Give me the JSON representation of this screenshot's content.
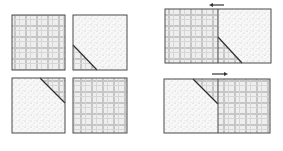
{
  "diagram": {
    "colors": {
      "background": "#ffffff",
      "outline": "#4a4a4a",
      "plaid_base": "#ececec",
      "plaid_line": "#b8b8b8",
      "dot_base": "#f7f7f7",
      "dot": "#b0b0b0"
    },
    "squares": [
      {
        "id": "plaid-square-top-left",
        "fabric": "plaid",
        "x": 12,
        "y": 15,
        "w": 53,
        "h": 55
      },
      {
        "id": "dotted-square-top-right",
        "fabric": "dotted",
        "x": 73,
        "y": 15,
        "w": 54,
        "h": 55,
        "corner": "bottom-left",
        "corner_fabric": "plaid"
      },
      {
        "id": "dotted-square-bottom-left",
        "fabric": "dotted",
        "x": 12,
        "y": 78,
        "w": 53,
        "h": 55,
        "corner": "top-right",
        "corner_fabric": "plaid"
      },
      {
        "id": "plaid-square-bottom-right",
        "fabric": "plaid",
        "x": 73,
        "y": 78,
        "w": 54,
        "h": 55
      }
    ],
    "units": [
      {
        "id": "unit-top",
        "x": 165,
        "y": 9,
        "w": 106,
        "h": 54,
        "divider_x": 218,
        "left": "plaid",
        "right": "dotted",
        "arrow": "left"
      },
      {
        "id": "unit-bottom",
        "x": 164,
        "y": 79,
        "w": 106,
        "h": 54,
        "divider_x": 218,
        "left": "dotted",
        "right": "plaid",
        "arrow": "right"
      }
    ],
    "arrows": [
      {
        "id": "press-arrow-left",
        "direction": "left",
        "x1": 224,
        "x2": 209,
        "y": 5
      },
      {
        "id": "press-arrow-right",
        "direction": "right",
        "x1": 212,
        "x2": 228,
        "y": 74
      }
    ]
  }
}
